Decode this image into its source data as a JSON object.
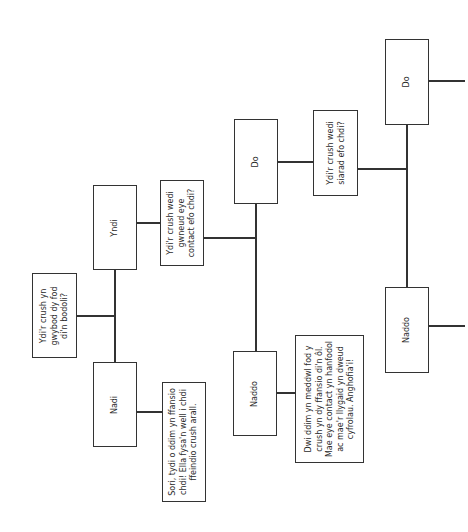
{
  "diagram": {
    "orientation": "rotated-90-ccw",
    "colors": {
      "stroke": "#333333",
      "text": "#2a2a2a",
      "background": "#ffffff"
    },
    "nodes": {
      "q1": {
        "type": "question",
        "text": "Ydi'r crush yn gwybod dy fod di'n bodoli?"
      },
      "q1_yes": {
        "type": "answer",
        "text": "Yndi"
      },
      "q1_no": {
        "type": "answer",
        "text": "Nadi"
      },
      "q1_no_result": {
        "type": "result",
        "text": "Sori, tydi o ddim yn ffansio chdi! Ella fysa'n well i chdi ffeindio crush arall."
      },
      "q2": {
        "type": "question",
        "text": "Ydi'r crush wedi gwneud eye contact efo chdi?"
      },
      "q2_yes": {
        "type": "answer",
        "text": "Do"
      },
      "q2_no": {
        "type": "answer",
        "text": "Naddo"
      },
      "q2_no_result": {
        "type": "result",
        "text": "Dwi ddim yn meddwl fod y crush yn dy ffansio di'n ôl. Mae eye contact yn hanfodol ac mae'r llygaid yn dweud cyfrolau. Anghofia'i!"
      },
      "q3": {
        "type": "question",
        "text": "Ydi'r crush wedi siarad efo chdi?"
      },
      "q3_yes": {
        "type": "answer",
        "text": "Do"
      },
      "q3_no": {
        "type": "answer",
        "text": "Naddo"
      }
    },
    "edges": [
      [
        "q1",
        "q1_yes"
      ],
      [
        "q1",
        "q1_no"
      ],
      [
        "q1_no",
        "q1_no_result"
      ],
      [
        "q1_yes",
        "q2"
      ],
      [
        "q2",
        "q2_yes"
      ],
      [
        "q2",
        "q2_no"
      ],
      [
        "q2_no",
        "q2_no_result"
      ],
      [
        "q2_yes",
        "q3"
      ],
      [
        "q3",
        "q3_yes"
      ],
      [
        "q3",
        "q3_no"
      ]
    ]
  }
}
